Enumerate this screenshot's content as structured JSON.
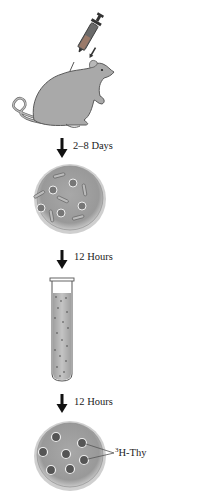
{
  "diagram": {
    "steps": [
      {
        "id": "injection",
        "description": "rat injected with syringe"
      },
      {
        "id": "arrow1",
        "label": "2–8 Days"
      },
      {
        "id": "dish1",
        "description": "culture dish with mixed cells"
      },
      {
        "id": "arrow2",
        "label": "12 Hours"
      },
      {
        "id": "tube",
        "description": "test tube with cell suspension"
      },
      {
        "id": "arrow3",
        "label": "12 Hours"
      },
      {
        "id": "dish2",
        "description": "culture dish with labeled cells"
      }
    ],
    "annotation": {
      "superscript": "3",
      "text": "H-Thy"
    }
  },
  "colors": {
    "rat_fill": "#a9a9a9",
    "rat_stroke": "#5a5a5a",
    "dish_fill": "#9e9e9e",
    "dish_rim": "#bdbdbd",
    "arrow": "#111111",
    "text": "#222222"
  },
  "icons": {
    "syringe": "syringe-icon",
    "rat": "rat-icon",
    "dish": "petri-dish-icon",
    "tube": "test-tube-icon",
    "arrow": "arrow-down-icon"
  }
}
